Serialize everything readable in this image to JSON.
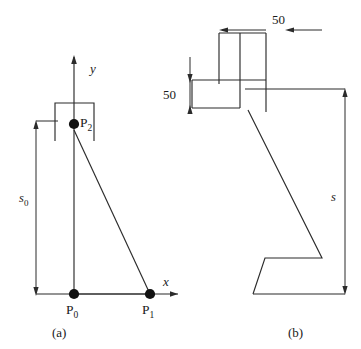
{
  "figure": {
    "panel_a": {
      "caption": "(a)",
      "axis_x_label": "x",
      "axis_y_label": "y",
      "points": [
        {
          "id": "p0",
          "label": "P",
          "subscript": "0"
        },
        {
          "id": "p1",
          "label": "P",
          "subscript": "1"
        },
        {
          "id": "p2",
          "label": "P",
          "subscript": "2"
        }
      ],
      "dimension": {
        "label": "s",
        "subscript": "0"
      }
    },
    "panel_b": {
      "caption": "(b)",
      "dimension_horizontal": "50",
      "dimension_vertical": "50",
      "dimension_total": "s"
    },
    "colors": {
      "line": "#2b2b2b",
      "node": "#111111",
      "background": "#ffffff",
      "text": "#1a1a1a"
    }
  }
}
